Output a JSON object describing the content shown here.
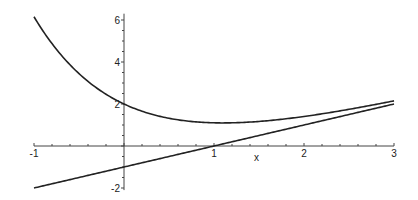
{
  "chart_data": {
    "type": "line",
    "title": "",
    "xlabel": "x",
    "ylabel": "",
    "xlim": [
      -1,
      3
    ],
    "ylim": [
      -2.1,
      6.3
    ],
    "grid": false,
    "legend": null,
    "x_ticks": [
      -1,
      1,
      2,
      3
    ],
    "x_tick_labels": [
      "-1",
      "1",
      "2",
      "3"
    ],
    "y_ticks": [
      -2,
      2,
      4,
      6
    ],
    "y_tick_labels": [
      "-2",
      "2",
      "4",
      "6"
    ],
    "series": [
      {
        "name": "curve",
        "expression": "x - 1 + 3*exp(-x)",
        "x": [
          -1,
          -0.5,
          0,
          0.5,
          1,
          1.5,
          2,
          2.5,
          3
        ],
        "y": [
          6.15,
          3.45,
          2.0,
          1.32,
          1.1,
          1.17,
          1.41,
          1.75,
          2.15
        ]
      },
      {
        "name": "line",
        "expression": "x - 1",
        "x": [
          -1,
          0,
          1,
          2,
          3
        ],
        "y": [
          -2,
          -1,
          0,
          1,
          2
        ]
      }
    ]
  },
  "layout": {
    "origin_px": [
      124,
      146
    ],
    "x_unit_px": 90,
    "y_unit_px": 21
  }
}
